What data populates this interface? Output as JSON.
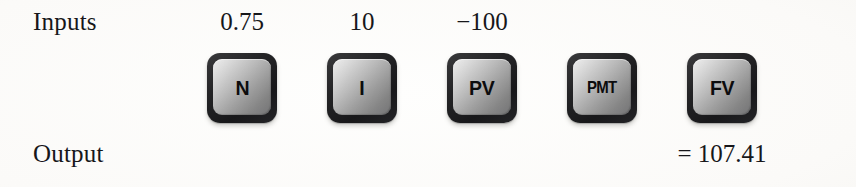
{
  "figure": {
    "inputs_label": "Inputs",
    "output_label": "Output",
    "background_color": "#fdfcfa",
    "key_bezel_color": "#1e1e20",
    "key_face_color": "#b4b4b4",
    "text_color": "#17171a"
  },
  "keys": [
    {
      "name": "n",
      "cap": "N",
      "input_value": "0.75",
      "output_value": ""
    },
    {
      "name": "i",
      "cap": "I",
      "input_value": "10",
      "output_value": ""
    },
    {
      "name": "pv",
      "cap": "PV",
      "input_value": "−100",
      "output_value": ""
    },
    {
      "name": "pmt",
      "cap": "PMT",
      "input_value": "",
      "output_value": ""
    },
    {
      "name": "fv",
      "cap": "FV",
      "input_value": "",
      "output_value": "= 107.41"
    }
  ],
  "values": {
    "n": "0.75",
    "i": "10",
    "pv": "−100",
    "pmt": "",
    "fv_result": "= 107.41"
  }
}
